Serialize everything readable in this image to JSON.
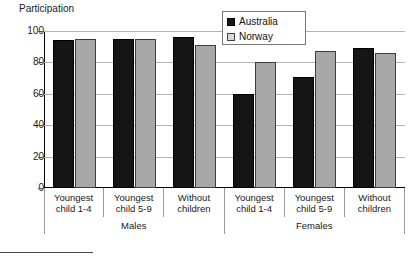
{
  "chart_data": {
    "type": "bar",
    "title": "Participation",
    "xlabel": "",
    "ylabel": "",
    "ylim": [
      0,
      100
    ],
    "yticks": [
      0,
      20,
      40,
      60,
      80,
      100
    ],
    "grid": true,
    "legend_position": "upper-right-inside",
    "categories": [
      "Youngest child 1-4",
      "Youngest child 5-9",
      "Without children",
      "Youngest child 1-4",
      "Youngest child 5-9",
      "Without children"
    ],
    "category_lines": [
      [
        "Youngest",
        "child 1-4"
      ],
      [
        "Youngest",
        "child 5-9"
      ],
      [
        "Without",
        "children"
      ],
      [
        "Youngest",
        "child 1-4"
      ],
      [
        "Youngest",
        "child 5-9"
      ],
      [
        "Without",
        "children"
      ]
    ],
    "groups": [
      {
        "label": "Males",
        "span": 3
      },
      {
        "label": "Females",
        "span": 3
      }
    ],
    "series": [
      {
        "name": "Australia",
        "color": "#151515",
        "values": [
          94,
          95,
          96,
          60,
          71,
          89
        ]
      },
      {
        "name": "Norway",
        "color": "#a8a8a8",
        "values": [
          95,
          95,
          91,
          80,
          87,
          86
        ]
      }
    ]
  },
  "legend": {
    "items": [
      {
        "label": "Australia",
        "swatch": "au"
      },
      {
        "label": "Norway",
        "swatch": "no"
      }
    ]
  }
}
